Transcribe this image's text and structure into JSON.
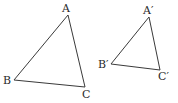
{
  "figure": {
    "triangles": [
      {
        "name": "ABC",
        "vertices": [
          {
            "label": "A",
            "x": 68,
            "y": 15,
            "lx": 62,
            "ly": 12
          },
          {
            "label": "B",
            "x": 14,
            "y": 80,
            "lx": 3,
            "ly": 84
          },
          {
            "label": "C",
            "x": 85,
            "y": 87,
            "lx": 82,
            "ly": 98
          }
        ]
      },
      {
        "name": "A'B'C'",
        "vertices": [
          {
            "label": "A′",
            "x": 149,
            "y": 17,
            "lx": 143,
            "ly": 14
          },
          {
            "label": "B′",
            "x": 111,
            "y": 64,
            "lx": 98,
            "ly": 68
          },
          {
            "label": "C′",
            "x": 160,
            "y": 70,
            "lx": 158,
            "ly": 80
          }
        ]
      }
    ]
  }
}
